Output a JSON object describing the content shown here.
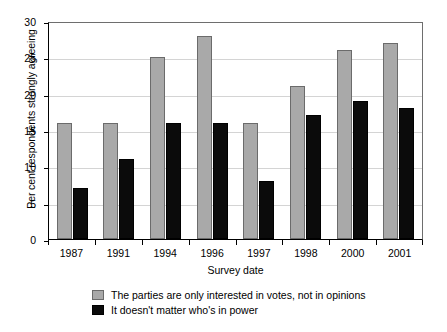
{
  "chart_data": {
    "type": "bar",
    "title": "",
    "xlabel": "Survey date",
    "ylabel": "Per cent respondents strongly agreeing",
    "categories": [
      "1987",
      "1991",
      "1994",
      "1996",
      "1997",
      "1998",
      "2000",
      "2001"
    ],
    "series": [
      {
        "name": "The parties are only interested in votes, not in opinions",
        "color": "#a9a9a9",
        "values": [
          16,
          16,
          25,
          28,
          16,
          21,
          26,
          27
        ]
      },
      {
        "name": "It doesn't matter who's in power",
        "color": "#0b0b0b",
        "values": [
          7,
          11,
          16,
          16,
          8,
          17,
          19,
          18
        ]
      }
    ],
    "ylim": [
      0,
      30
    ],
    "yticks": [
      0,
      5,
      10,
      15,
      20,
      25,
      30
    ],
    "ytick_labels": [
      "0",
      "5",
      "10",
      "15",
      "20",
      "25",
      "30"
    ],
    "grid": true,
    "legend_position": "bottom"
  },
  "legend": {
    "items": [
      {
        "label": "The parties are only interested in votes, not in opinions",
        "swatch": "grey-swatch"
      },
      {
        "label": "It doesn't matter who's in power",
        "swatch": "black-swatch"
      }
    ]
  }
}
